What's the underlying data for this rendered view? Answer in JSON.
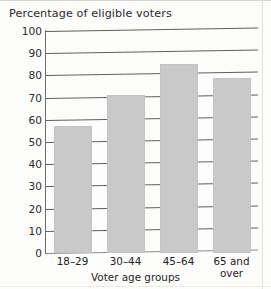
{
  "chart_data": {
    "type": "bar",
    "title": "Percentage of eligible voters",
    "xlabel": "Voter age groups",
    "ylabel": "",
    "categories": [
      "18–29",
      "30–44",
      "45–64",
      "65 and over"
    ],
    "values": [
      57,
      71,
      85,
      79
    ],
    "ylim": [
      0,
      100
    ],
    "yticks": [
      "0",
      "10",
      "20",
      "30",
      "40",
      "50",
      "60",
      "70",
      "80",
      "90",
      "100"
    ],
    "ytick_values": [
      0,
      10,
      20,
      30,
      40,
      50,
      60,
      70,
      80,
      90,
      100
    ],
    "grid": true,
    "legend": false,
    "bar_color": "#c9c9c9",
    "axis_color": "#5f5f5f",
    "text_color": "#242424"
  },
  "figure": {
    "title": "Percentage of eligible voters",
    "xaxis_title": "Voter age groups"
  }
}
